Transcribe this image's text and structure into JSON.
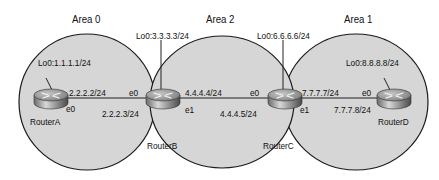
{
  "areas": [
    {
      "id": "area0",
      "label": "Area 0"
    },
    {
      "id": "area2",
      "label": "Area 2"
    },
    {
      "id": "area1",
      "label": "Area 1"
    }
  ],
  "routers": [
    {
      "id": "routerA",
      "name": "RouterA",
      "loopback": "Lo0:1.1.1.1/24"
    },
    {
      "id": "routerB",
      "name": "RouterB",
      "loopback": "Lo0:3.3.3.3/24"
    },
    {
      "id": "routerC",
      "name": "RouterC",
      "loopback": "Lo0:6.6.6.6/24"
    },
    {
      "id": "routerD",
      "name": "RouterD",
      "loopback": "Lo0:8.8.8.8/24"
    }
  ],
  "links": [
    {
      "from": "RouterA",
      "to": "RouterB",
      "a_if": "e0",
      "a_ip": "2.2.2.2/24",
      "b_if": "e0",
      "b_ip": "2.2.2.3/24"
    },
    {
      "from": "RouterB",
      "to": "RouterC",
      "a_if": "e1",
      "a_ip": "4.4.4.4/24",
      "b_if": "e0",
      "b_ip": "4.4.4.5/24"
    },
    {
      "from": "RouterC",
      "to": "RouterD",
      "a_if": "e1",
      "a_ip": "7.7.7.7/24",
      "b_if": "e0",
      "b_ip": "7.7.7.8/24"
    }
  ],
  "colors": {
    "area_fill": "#d6d6d6",
    "outline": "#1a1a1a",
    "router_body": "#9a9a9a"
  }
}
